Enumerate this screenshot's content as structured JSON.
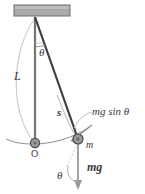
{
  "figure": {
    "labels": {
      "theta_top": "θ",
      "length": "L",
      "arc_length": "s",
      "tangential_force": "mg sin θ",
      "mass": "m",
      "origin": "O",
      "weight": "mg",
      "theta_bottom": "θ"
    },
    "parts": [
      "ceiling-support",
      "pendulum-rod",
      "vertical-reference-line",
      "pendulum-bob",
      "origin-marker",
      "swing-arc",
      "length-arc",
      "angle-arc-top",
      "angle-arc-bottom",
      "weight-arrow",
      "tangential-force-arrow",
      "leader-line"
    ],
    "colors": {
      "ink": "#3a3a3a",
      "rod": "#4a4a4a",
      "support_fill": "#a9a9a9",
      "support_stroke": "#6e6e6e",
      "bob_fill": "#9a9a9a",
      "bob_stroke": "#4a4a4a",
      "light_line": "#b9b9b9",
      "arrow": "#8c8c8c",
      "background": "#ffffff"
    },
    "geometry": {
      "pivot": [
        35,
        18
      ],
      "origin": [
        35,
        143
      ],
      "bob": [
        78,
        139
      ],
      "rod_length_px": 125,
      "angle_deg": 19
    }
  }
}
